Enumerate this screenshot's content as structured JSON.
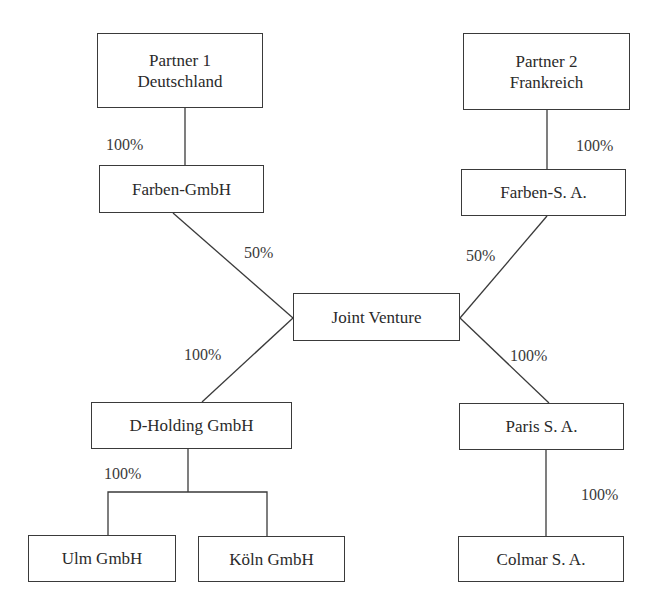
{
  "diagram": {
    "type": "ownership-structure",
    "nodes": {
      "partner1": {
        "line1": "Partner 1",
        "line2": "Deutschland"
      },
      "partner2": {
        "line1": "Partner 2",
        "line2": "Frankreich"
      },
      "farben_gmbh": {
        "label": "Farben-GmbH"
      },
      "farben_sa": {
        "label": "Farben-S. A."
      },
      "joint_venture": {
        "label": "Joint Venture"
      },
      "d_holding": {
        "label": "D-Holding GmbH"
      },
      "paris_sa": {
        "label": "Paris S. A."
      },
      "ulm_gmbh": {
        "label": "Ulm GmbH"
      },
      "koeln_gmbh": {
        "label": "Köln GmbH"
      },
      "colmar_sa": {
        "label": "Colmar S. A."
      }
    },
    "edges": [
      {
        "from": "partner1",
        "to": "farben_gmbh",
        "share": "100%"
      },
      {
        "from": "partner2",
        "to": "farben_sa",
        "share": "100%"
      },
      {
        "from": "farben_gmbh",
        "to": "joint_venture",
        "share": "50%"
      },
      {
        "from": "farben_sa",
        "to": "joint_venture",
        "share": "50%"
      },
      {
        "from": "joint_venture",
        "to": "d_holding",
        "share": "100%"
      },
      {
        "from": "joint_venture",
        "to": "paris_sa",
        "share": "100%"
      },
      {
        "from": "d_holding",
        "to": "ulm_gmbh",
        "share": "100%"
      },
      {
        "from": "d_holding",
        "to": "koeln_gmbh",
        "share": "100%"
      },
      {
        "from": "paris_sa",
        "to": "colmar_sa",
        "share": "100%"
      }
    ],
    "labels": {
      "p1_to_farben_gmbh": "100%",
      "p2_to_farben_sa": "100%",
      "farben_gmbh_to_jv": "50%",
      "farben_sa_to_jv": "50%",
      "jv_to_d_holding": "100%",
      "jv_to_paris_sa": "100%",
      "d_holding_to_subs": "100%",
      "paris_to_colmar": "100%"
    },
    "colors": {
      "line": "#3a3a3a",
      "text": "#2a2a2a",
      "background": "#ffffff"
    }
  }
}
